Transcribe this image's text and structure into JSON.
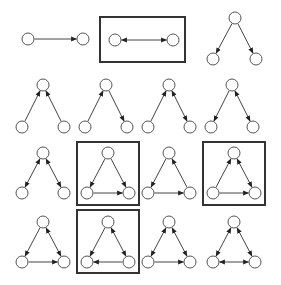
{
  "diagram": {
    "title": "",
    "colors": {
      "node_fill": "#ffffff",
      "node_stroke": "#555555",
      "edge": "#444444",
      "box": "#333333"
    },
    "node_radius": 6,
    "motifs": [
      {
        "id": "m1",
        "row": 1,
        "nodes": [
          [
            28,
            39
          ],
          [
            83,
            39
          ]
        ],
        "edges": [
          {
            "from": 0,
            "to": 1,
            "bidir": false
          }
        ],
        "highlighted": false
      },
      {
        "id": "m2",
        "row": 1,
        "nodes": [
          [
            115,
            40
          ],
          [
            173,
            40
          ]
        ],
        "edges": [
          {
            "from": 0,
            "to": 1,
            "bidir": true
          }
        ],
        "highlighted": true,
        "box": [
          100,
          17,
          85,
          45
        ]
      },
      {
        "id": "m3",
        "row": 1,
        "nodes": [
          [
            235,
            18
          ],
          [
            213,
            59
          ],
          [
            256,
            59
          ]
        ],
        "edges": [
          {
            "from": 0,
            "to": 1,
            "bidir": false
          },
          {
            "from": 0,
            "to": 2,
            "bidir": false
          }
        ],
        "highlighted": false
      },
      {
        "id": "m4",
        "row": 2,
        "nodes": [
          [
            43,
            85
          ],
          [
            22,
            127
          ],
          [
            64,
            127
          ]
        ],
        "edges": [
          {
            "from": 1,
            "to": 0,
            "bidir": false
          },
          {
            "from": 2,
            "to": 0,
            "bidir": false
          }
        ],
        "highlighted": false
      },
      {
        "id": "m5",
        "row": 2,
        "nodes": [
          [
            106,
            85
          ],
          [
            85,
            127
          ],
          [
            127,
            127
          ]
        ],
        "edges": [
          {
            "from": 1,
            "to": 0,
            "bidir": false
          },
          {
            "from": 0,
            "to": 2,
            "bidir": false
          }
        ],
        "highlighted": false
      },
      {
        "id": "m6",
        "row": 2,
        "nodes": [
          [
            169,
            85
          ],
          [
            148,
            127
          ],
          [
            190,
            127
          ]
        ],
        "edges": [
          {
            "from": 1,
            "to": 0,
            "bidir": false
          },
          {
            "from": 0,
            "to": 2,
            "bidir": true
          }
        ],
        "highlighted": false
      },
      {
        "id": "m7",
        "row": 2,
        "nodes": [
          [
            232,
            85
          ],
          [
            211,
            127
          ],
          [
            253,
            127
          ]
        ],
        "edges": [
          {
            "from": 0,
            "to": 1,
            "bidir": false
          },
          {
            "from": 0,
            "to": 2,
            "bidir": true
          }
        ],
        "highlighted": false
      },
      {
        "id": "m8",
        "row": 3,
        "nodes": [
          [
            43,
            153
          ],
          [
            22,
            193
          ],
          [
            64,
            193
          ]
        ],
        "edges": [
          {
            "from": 0,
            "to": 1,
            "bidir": true
          },
          {
            "from": 0,
            "to": 2,
            "bidir": true
          }
        ],
        "highlighted": false
      },
      {
        "id": "m9",
        "row": 3,
        "nodes": [
          [
            108,
            153
          ],
          [
            87,
            193
          ],
          [
            129,
            193
          ]
        ],
        "edges": [
          {
            "from": 0,
            "to": 1,
            "bidir": false
          },
          {
            "from": 0,
            "to": 2,
            "bidir": false
          },
          {
            "from": 1,
            "to": 2,
            "bidir": false
          }
        ],
        "highlighted": true,
        "box": [
          77,
          142,
          62,
          63
        ]
      },
      {
        "id": "m10",
        "row": 3,
        "nodes": [
          [
            169,
            153
          ],
          [
            148,
            193
          ],
          [
            190,
            193
          ]
        ],
        "edges": [
          {
            "from": 0,
            "to": 1,
            "bidir": false
          },
          {
            "from": 1,
            "to": 2,
            "bidir": false
          },
          {
            "from": 2,
            "to": 0,
            "bidir": false
          }
        ],
        "highlighted": false
      },
      {
        "id": "m11",
        "row": 3,
        "nodes": [
          [
            234,
            153
          ],
          [
            213,
            193
          ],
          [
            255,
            193
          ]
        ],
        "edges": [
          {
            "from": 1,
            "to": 0,
            "bidir": false
          },
          {
            "from": 0,
            "to": 2,
            "bidir": true
          },
          {
            "from": 1,
            "to": 2,
            "bidir": false
          }
        ],
        "highlighted": true,
        "box": [
          203,
          142,
          62,
          63
        ]
      },
      {
        "id": "m12",
        "row": 4,
        "nodes": [
          [
            43,
            222
          ],
          [
            22,
            262
          ],
          [
            64,
            262
          ]
        ],
        "edges": [
          {
            "from": 0,
            "to": 1,
            "bidir": false
          },
          {
            "from": 0,
            "to": 2,
            "bidir": true
          },
          {
            "from": 1,
            "to": 2,
            "bidir": false
          }
        ],
        "highlighted": false
      },
      {
        "id": "m13",
        "row": 4,
        "nodes": [
          [
            108,
            222
          ],
          [
            87,
            262
          ],
          [
            129,
            262
          ]
        ],
        "edges": [
          {
            "from": 0,
            "to": 1,
            "bidir": false
          },
          {
            "from": 0,
            "to": 2,
            "bidir": true
          },
          {
            "from": 2,
            "to": 1,
            "bidir": false
          }
        ],
        "highlighted": true,
        "box": [
          77,
          210,
          62,
          63
        ]
      },
      {
        "id": "m14",
        "row": 4,
        "nodes": [
          [
            169,
            222
          ],
          [
            148,
            262
          ],
          [
            190,
            262
          ]
        ],
        "edges": [
          {
            "from": 0,
            "to": 1,
            "bidir": true
          },
          {
            "from": 0,
            "to": 2,
            "bidir": true
          },
          {
            "from": 1,
            "to": 2,
            "bidir": false
          }
        ],
        "highlighted": false
      },
      {
        "id": "m15",
        "row": 4,
        "nodes": [
          [
            234,
            222
          ],
          [
            213,
            262
          ],
          [
            255,
            262
          ]
        ],
        "edges": [
          {
            "from": 0,
            "to": 1,
            "bidir": true
          },
          {
            "from": 0,
            "to": 2,
            "bidir": true
          },
          {
            "from": 1,
            "to": 2,
            "bidir": true
          }
        ],
        "highlighted": false
      }
    ]
  }
}
